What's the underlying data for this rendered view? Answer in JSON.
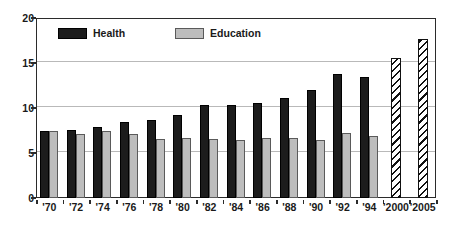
{
  "chart_data": {
    "type": "bar",
    "title": "",
    "subtitle": "",
    "xlabel": "",
    "ylabel": "",
    "ylim": [
      0,
      20
    ],
    "yticks": [
      0,
      5,
      10,
      15,
      20
    ],
    "grid": true,
    "legend_position": "top-left",
    "categories": [
      "'70",
      "'72",
      "'74",
      "'76",
      "'78",
      "'80",
      "'82",
      "'84",
      "'86",
      "'88",
      "'90",
      "'92",
      "'94",
      "'2000",
      "'2005"
    ],
    "series": [
      {
        "name": "Health",
        "color": "#1c1c1c",
        "values": [
          7.4,
          7.6,
          7.9,
          8.5,
          8.7,
          9.2,
          10.3,
          10.3,
          10.6,
          11.1,
          12.0,
          13.8,
          13.4,
          null,
          null
        ]
      },
      {
        "name": "Education",
        "color": "#bdbdbd",
        "values": [
          7.5,
          7.1,
          7.5,
          7.1,
          6.6,
          6.7,
          6.6,
          6.5,
          6.7,
          6.7,
          6.5,
          7.2,
          6.9,
          null,
          null
        ]
      },
      {
        "name": "Projected",
        "color": "#ffffff",
        "hatched": true,
        "values": [
          null,
          null,
          null,
          null,
          null,
          null,
          null,
          null,
          null,
          null,
          null,
          null,
          null,
          15.6,
          17.7
        ]
      }
    ]
  },
  "legend": {
    "entries": [
      {
        "label": "Health",
        "swatch": "health"
      },
      {
        "label": "Education",
        "swatch": "education"
      }
    ]
  },
  "axis": {
    "y_tick_labels": [
      "0",
      "5",
      "10",
      "15",
      "20"
    ],
    "x_tick_labels": [
      "'70",
      "'72",
      "'74",
      "'76",
      "'78",
      "'80",
      "'82",
      "'84",
      "'86",
      "'88",
      "'90",
      "'92",
      "'94",
      "'2000",
      "'2005"
    ]
  },
  "colors": {
    "health": "#1c1c1c",
    "education": "#bdbdbd",
    "grid": "#b9b9b9",
    "axis": "#2b2b2b",
    "background": "#ffffff"
  }
}
